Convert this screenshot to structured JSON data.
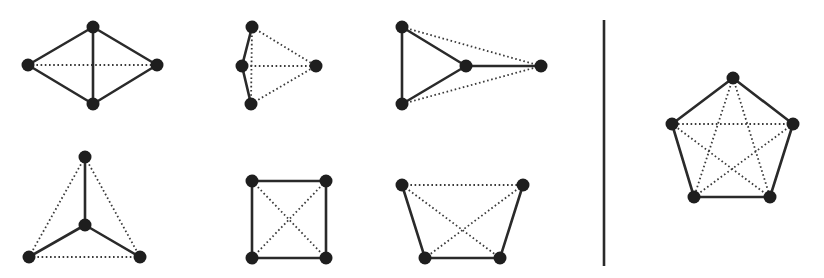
{
  "figure": {
    "colors": {
      "solid_edge": "#2a2a2a",
      "dotted_edge": "#3a3a3a",
      "vertex": "#1e1e1e",
      "background": "#ffffff"
    },
    "vertex_radius": 6.5,
    "divider": {
      "x": 604,
      "y1": 20,
      "y2": 266
    },
    "graphs": [
      {
        "id": "k4-rhombus",
        "vertices": [
          [
            28,
            65
          ],
          [
            93,
            27
          ],
          [
            157,
            65
          ],
          [
            93,
            104
          ]
        ],
        "solid": [
          [
            0,
            1
          ],
          [
            1,
            2
          ],
          [
            2,
            3
          ],
          [
            3,
            0
          ],
          [
            1,
            3
          ]
        ],
        "dotted": [
          [
            0,
            2
          ]
        ]
      },
      {
        "id": "k4-fan",
        "vertices": [
          [
            252,
            27
          ],
          [
            242,
            66
          ],
          [
            251,
            104
          ],
          [
            316,
            66
          ]
        ],
        "solid": [
          [
            0,
            1
          ],
          [
            1,
            2
          ]
        ],
        "dotted": [
          [
            0,
            2
          ],
          [
            0,
            3
          ],
          [
            1,
            3
          ],
          [
            2,
            3
          ]
        ]
      },
      {
        "id": "k4-triangle-tail",
        "vertices": [
          [
            402,
            27
          ],
          [
            402,
            104
          ],
          [
            466,
            66
          ],
          [
            541,
            66
          ]
        ],
        "solid": [
          [
            0,
            1
          ],
          [
            0,
            2
          ],
          [
            1,
            2
          ],
          [
            2,
            3
          ]
        ],
        "dotted": [
          [
            0,
            3
          ],
          [
            1,
            3
          ]
        ]
      },
      {
        "id": "k4-star",
        "vertices": [
          [
            85,
            157
          ],
          [
            85,
            225
          ],
          [
            29,
            257
          ],
          [
            140,
            257
          ]
        ],
        "solid": [
          [
            0,
            1
          ],
          [
            1,
            2
          ],
          [
            1,
            3
          ]
        ],
        "dotted": [
          [
            0,
            2
          ],
          [
            0,
            3
          ],
          [
            2,
            3
          ]
        ]
      },
      {
        "id": "k4-square",
        "vertices": [
          [
            252,
            181
          ],
          [
            326,
            181
          ],
          [
            252,
            258
          ],
          [
            326,
            258
          ]
        ],
        "solid": [
          [
            0,
            1
          ],
          [
            1,
            3
          ],
          [
            3,
            2
          ],
          [
            2,
            0
          ]
        ],
        "dotted": [
          [
            0,
            3
          ],
          [
            1,
            2
          ]
        ]
      },
      {
        "id": "k4-trapezoid",
        "vertices": [
          [
            402,
            185
          ],
          [
            523,
            185
          ],
          [
            425,
            258
          ],
          [
            500,
            258
          ]
        ],
        "solid": [
          [
            0,
            2
          ],
          [
            2,
            3
          ],
          [
            3,
            1
          ]
        ],
        "dotted": [
          [
            0,
            1
          ],
          [
            0,
            3
          ],
          [
            1,
            2
          ]
        ]
      },
      {
        "id": "k5-pentagon",
        "vertices": [
          [
            733,
            78
          ],
          [
            793,
            124
          ],
          [
            770,
            197
          ],
          [
            694,
            197
          ],
          [
            672,
            124
          ]
        ],
        "solid": [
          [
            0,
            1
          ],
          [
            1,
            2
          ],
          [
            2,
            3
          ],
          [
            3,
            4
          ],
          [
            4,
            0
          ]
        ],
        "dotted": [
          [
            0,
            2
          ],
          [
            0,
            3
          ],
          [
            1,
            3
          ],
          [
            1,
            4
          ],
          [
            2,
            4
          ]
        ]
      }
    ]
  }
}
